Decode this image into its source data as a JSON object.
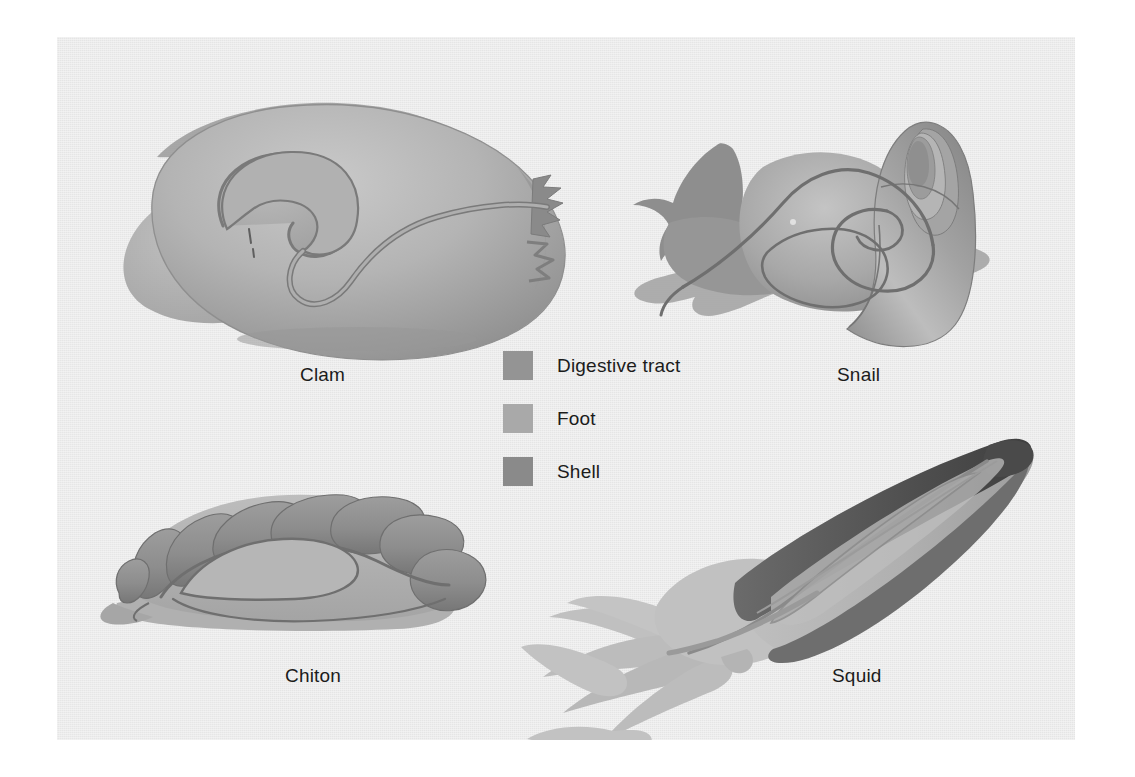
{
  "figure": {
    "background_color": "#ebebeb",
    "page_color": "#ffffff"
  },
  "organisms": [
    {
      "id": "clam",
      "label": "Clam"
    },
    {
      "id": "snail",
      "label": "Snail"
    },
    {
      "id": "chiton",
      "label": "Chiton"
    },
    {
      "id": "squid",
      "label": "Squid"
    }
  ],
  "legend": {
    "items": [
      {
        "label": "Digestive tract",
        "color": "#949494"
      },
      {
        "label": "Foot",
        "color": "#a9a9a9"
      },
      {
        "label": "Shell",
        "color": "#8a8a8a"
      }
    ]
  },
  "palette": {
    "digestive_tract": "#949494",
    "foot": "#a9a9a9",
    "shell": "#8a8a8a",
    "shell_dark": "#5f5f5f",
    "outline": "#6e6e6e",
    "text": "#1b1b1b"
  }
}
